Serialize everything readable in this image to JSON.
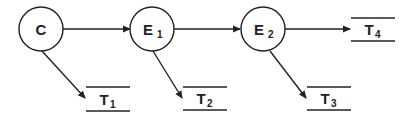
{
  "diagram": {
    "nodes": [
      {
        "id": "C",
        "label": "C",
        "sub": ""
      },
      {
        "id": "E1",
        "label": "E",
        "sub": "1"
      },
      {
        "id": "E2",
        "label": "E",
        "sub": "2"
      }
    ],
    "terminals": [
      {
        "id": "T1",
        "label": "T",
        "sub": "1"
      },
      {
        "id": "T2",
        "label": "T",
        "sub": "2"
      },
      {
        "id": "T3",
        "label": "T",
        "sub": "3"
      },
      {
        "id": "T4",
        "label": "T",
        "sub": "4"
      }
    ],
    "edges": [
      {
        "from": "C",
        "to": "E1"
      },
      {
        "from": "E1",
        "to": "E2"
      },
      {
        "from": "E2",
        "to": "T4"
      },
      {
        "from": "C",
        "to": "T1"
      },
      {
        "from": "E1",
        "to": "T2"
      },
      {
        "from": "E2",
        "to": "T3"
      }
    ],
    "colors": {
      "stroke": "#222222",
      "background": "#ffffff"
    }
  }
}
